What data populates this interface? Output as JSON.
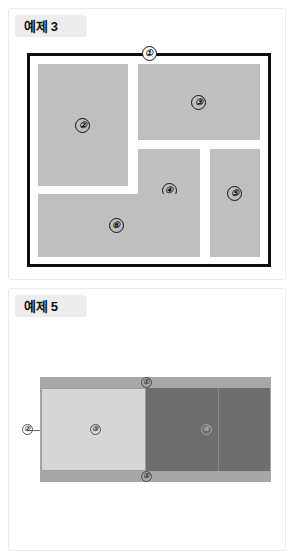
{
  "page": {
    "background_color": "#ffffff"
  },
  "panels": [
    {
      "id": "example3",
      "header_label": "예제 3",
      "diagram": {
        "type": "partitioned-square",
        "border_color": "#0d0d0d",
        "block_fill_color": "#bfbfbf",
        "marks": [
          {
            "label": "①",
            "position": "top-border"
          },
          {
            "label": "②",
            "position": "left-tall-block"
          },
          {
            "label": "③",
            "position": "top-right-block"
          },
          {
            "label": "④",
            "position": "center-block"
          },
          {
            "label": "⑤",
            "position": "right-tall-block"
          },
          {
            "label": "⑥",
            "position": "bottom-left-block"
          }
        ]
      }
    },
    {
      "id": "example5",
      "header_label": "예제 5",
      "diagram": {
        "type": "two-tone-band",
        "frame_color": "#a7a7a7",
        "left_panel_color": "#d6d6d6",
        "right_panel_color": "#6d6d6d",
        "marks": [
          {
            "label": "①",
            "position": "top-edge"
          },
          {
            "label": "②",
            "position": "left-edge"
          },
          {
            "label": "③",
            "position": "left-panel-center"
          },
          {
            "label": "④",
            "position": "right-panel-center"
          },
          {
            "label": "⑤",
            "position": "bottom-edge"
          }
        ]
      }
    }
  ]
}
